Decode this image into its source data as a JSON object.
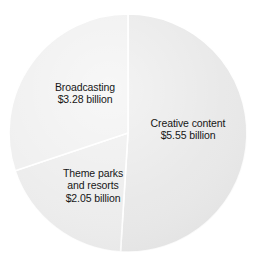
{
  "chart_data": {
    "type": "pie",
    "title": "",
    "subtitle": "",
    "xlabel": "",
    "ylabel": "",
    "unit": "billion USD",
    "legend_position": "none",
    "grid": false,
    "total": 10.88,
    "categories": [
      "Creative content",
      "Broadcasting",
      "Theme parks and resorts"
    ],
    "values": [
      5.55,
      3.28,
      2.05
    ],
    "slices": [
      {
        "name": "Creative content",
        "value": 5.55,
        "value_text": "$5.55 billion",
        "percent": 51.0,
        "start_angle": 0,
        "sweep_angle": 183.6,
        "color": "#e6e6e6",
        "label_lines": [
          "Creative content",
          "$5.55 billion"
        ]
      },
      {
        "name": "Theme parks and resorts",
        "value": 2.05,
        "value_text": "$2.05 billion",
        "percent": 18.8,
        "start_angle": 183.6,
        "sweep_angle": 67.9,
        "color": "#ebebeb",
        "label_lines": [
          "Theme parks",
          "and resorts",
          "$2.05 billion"
        ]
      },
      {
        "name": "Broadcasting",
        "value": 3.28,
        "value_text": "$3.28 billion",
        "percent": 30.1,
        "start_angle": 251.5,
        "sweep_angle": 108.5,
        "color": "#eeeeee",
        "label_lines": [
          "Broadcasting",
          "$3.28 billion"
        ]
      }
    ],
    "geometry": {
      "center_x": 128,
      "center_y": 133,
      "radius": 119
    },
    "style": {
      "background": "#ffffff",
      "divider_color": "#ffffff",
      "label_color": "#161616"
    }
  },
  "labels": {
    "creative": {
      "line1": "Creative content",
      "line2": "$5.55 billion"
    },
    "broadcasting": {
      "line1": "Broadcasting",
      "line2": "$3.28 billion"
    },
    "theme": {
      "line1": "Theme parks",
      "line2": "and resorts",
      "line3": "$2.05 billion"
    }
  }
}
